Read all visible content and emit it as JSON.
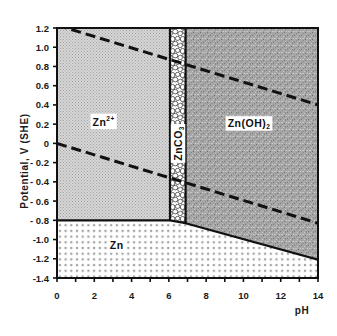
{
  "chart_data": {
    "type": "area",
    "title": "",
    "xlabel": "pH",
    "ylabel": "Potential, V (SHE)",
    "xlim": [
      0,
      14
    ],
    "ylim": [
      -1.4,
      1.2
    ],
    "grid": false,
    "legend": "none",
    "xticks": [
      0,
      2,
      4,
      6,
      8,
      10,
      12,
      14
    ],
    "xtick_labels": [
      "0",
      "2",
      "4",
      "6",
      "8",
      "10",
      "12",
      "14"
    ],
    "x_minor_step": 1,
    "yticks": [
      1.2,
      1.0,
      0.8,
      0.6,
      0.4,
      0.2,
      0,
      -0.2,
      -0.4,
      -0.6,
      -0.8,
      -1.0,
      -1.2,
      -1.4
    ],
    "ytick_labels": [
      "1.2",
      "1.0",
      "0.8",
      "0.6",
      "0.4",
      "0.2",
      "0",
      "- 0.2",
      "- 0.4",
      "- 0.6",
      "- 0.8",
      "-1.0",
      "-1.2",
      "-1.4"
    ],
    "regions": [
      {
        "id": "zn2plus",
        "label": "Zn",
        "sup": "2+",
        "sub": "",
        "pattern": "fine-gray-dots",
        "polygon": [
          [
            0,
            1.2
          ],
          [
            6.06,
            1.2
          ],
          [
            6.06,
            -0.8
          ],
          [
            0,
            -0.8
          ]
        ],
        "label_at": [
          2.5,
          0.22
        ],
        "rotate": false
      },
      {
        "id": "znco3",
        "label": "ZnCO",
        "sup": "",
        "sub": "3",
        "pattern": "cobblestone",
        "polygon": [
          [
            6.06,
            1.2
          ],
          [
            6.9,
            1.2
          ],
          [
            6.9,
            -0.83
          ],
          [
            6.06,
            -0.8
          ]
        ],
        "label_at": [
          6.48,
          0.0
        ],
        "rotate": true
      },
      {
        "id": "znoh2",
        "label": "Zn(OH)",
        "sup": "",
        "sub": "2",
        "pattern": "dark-speckle",
        "polygon": [
          [
            6.9,
            1.2
          ],
          [
            14,
            1.2
          ],
          [
            14,
            -1.21
          ],
          [
            6.9,
            -0.83
          ]
        ],
        "label_at": [
          10.3,
          0.21
        ],
        "rotate": false
      },
      {
        "id": "zn",
        "label": "Zn",
        "sup": "",
        "sub": "",
        "pattern": "square-dots",
        "polygon": [
          [
            0,
            -0.8
          ],
          [
            6.06,
            -0.8
          ],
          [
            6.9,
            -0.83
          ],
          [
            14,
            -1.21
          ],
          [
            14,
            -1.4
          ],
          [
            0,
            -1.4
          ]
        ],
        "label_at": [
          3.2,
          -1.06
        ],
        "rotate": false
      }
    ],
    "boundaries": [
      {
        "id": "zn2plus-znco3",
        "style": "solid",
        "points": [
          [
            6.06,
            1.2
          ],
          [
            6.06,
            -0.8
          ]
        ]
      },
      {
        "id": "znco3-znoh2",
        "style": "solid",
        "points": [
          [
            6.9,
            1.2
          ],
          [
            6.9,
            -0.83
          ]
        ]
      },
      {
        "id": "zn-lower",
        "style": "solid",
        "points": [
          [
            0,
            -0.8
          ],
          [
            6.06,
            -0.8
          ],
          [
            6.9,
            -0.83
          ],
          [
            14,
            -1.21
          ]
        ]
      }
    ],
    "water_lines": [
      {
        "id": "o2-h2o",
        "style": "dashed",
        "points": [
          [
            0,
            1.23
          ],
          [
            14,
            0.4
          ]
        ]
      },
      {
        "id": "h-h2",
        "style": "dashed",
        "points": [
          [
            0,
            0.0
          ],
          [
            14,
            -0.83
          ]
        ]
      }
    ]
  }
}
